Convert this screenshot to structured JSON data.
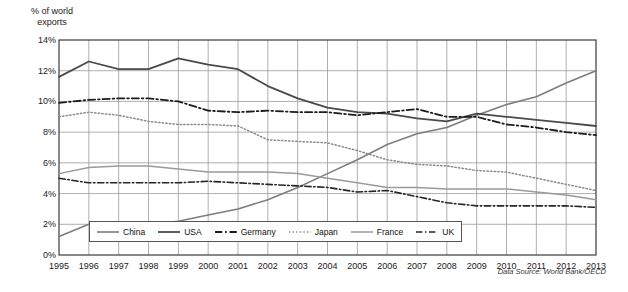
{
  "chart_data": {
    "type": "line",
    "title": "",
    "ylabel": "% of world exports",
    "xlabel": "",
    "ylim": [
      0,
      14
    ],
    "ytick_labels": [
      "0%",
      "2%",
      "4%",
      "6%",
      "8%",
      "10%",
      "12%",
      "14%"
    ],
    "ytick_values": [
      0,
      2,
      4,
      6,
      8,
      10,
      12,
      14
    ],
    "grid": true,
    "legend_position": "bottom-left-inside",
    "source_note": "Data Source: World Bank/OECD",
    "x": [
      1995,
      1996,
      1997,
      1998,
      1999,
      2000,
      2001,
      2002,
      2003,
      2004,
      2005,
      2006,
      2007,
      2008,
      2009,
      2010,
      2011,
      2012,
      2013
    ],
    "xtick_labels": [
      "1995",
      "1996",
      "1997",
      "1998",
      "1999",
      "2000",
      "2001",
      "2002",
      "2003",
      "2004",
      "2005",
      "2006",
      "2007",
      "2008",
      "2009",
      "2010",
      "2011",
      "2012",
      "2013"
    ],
    "series": [
      {
        "name": "China",
        "style": "solid",
        "color": "#7d7d7d",
        "width": 1.6,
        "values": [
          1.2,
          2.0,
          2.0,
          2.0,
          2.2,
          2.6,
          3.0,
          3.6,
          4.4,
          5.3,
          6.2,
          7.2,
          7.9,
          8.3,
          9.1,
          9.8,
          10.3,
          11.2,
          12.0
        ]
      },
      {
        "name": "USA",
        "style": "solid",
        "color": "#4a4a4a",
        "width": 1.8,
        "values": [
          11.6,
          12.6,
          12.1,
          12.1,
          12.8,
          12.4,
          12.1,
          11.0,
          10.2,
          9.6,
          9.3,
          9.2,
          8.9,
          8.7,
          9.2,
          9.0,
          8.8,
          8.6,
          8.4
        ]
      },
      {
        "name": "Germany",
        "style": "dashdot",
        "color": "#1c1c1c",
        "width": 1.8,
        "values": [
          9.9,
          10.1,
          10.2,
          10.2,
          10.0,
          9.4,
          9.3,
          9.4,
          9.3,
          9.3,
          9.1,
          9.3,
          9.5,
          9.0,
          9.0,
          8.5,
          8.3,
          8.0,
          7.8
        ]
      },
      {
        "name": "Japan",
        "style": "dotted",
        "color": "#8a8a8a",
        "width": 1.5,
        "values": [
          9.0,
          9.3,
          9.1,
          8.7,
          8.5,
          8.5,
          8.4,
          7.5,
          7.4,
          7.3,
          6.8,
          6.2,
          5.9,
          5.8,
          5.5,
          5.4,
          5.0,
          4.6,
          4.2
        ]
      },
      {
        "name": "France",
        "style": "solid",
        "color": "#9a9a9a",
        "width": 1.5,
        "values": [
          5.3,
          5.7,
          5.8,
          5.8,
          5.6,
          5.4,
          5.4,
          5.4,
          5.3,
          5.0,
          4.7,
          4.4,
          4.4,
          4.3,
          4.3,
          4.3,
          4.1,
          3.9,
          3.6
        ]
      },
      {
        "name": "UK",
        "style": "dashdot",
        "color": "#262626",
        "width": 1.6,
        "values": [
          5.0,
          4.7,
          4.7,
          4.7,
          4.7,
          4.8,
          4.7,
          4.6,
          4.5,
          4.4,
          4.1,
          4.2,
          3.8,
          3.4,
          3.2,
          3.2,
          3.2,
          3.2,
          3.1
        ]
      }
    ]
  }
}
